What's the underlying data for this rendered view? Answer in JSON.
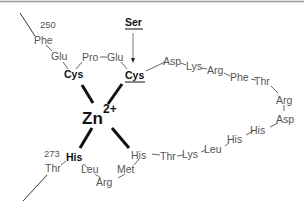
{
  "diagram": {
    "metal": {
      "symbol": "Zn",
      "charge": "2+"
    },
    "labels": {
      "start_number": "250",
      "end_number": "273",
      "mutation_label": "Ser"
    },
    "residues": {
      "phe250": "Phe",
      "glu1": "Glu",
      "cys1": "Cys",
      "pro": "Pro",
      "glu2": "Glu",
      "cys2": "Cys",
      "asp1": "Asp",
      "lys1": "Lys",
      "arg1": "Arg",
      "phe2": "Phe",
      "thr1": "Thr",
      "arg2": "Arg",
      "asp2": "Asp",
      "his_a": "His",
      "his_b": "His",
      "leu1": "Leu",
      "lys2": "Lys",
      "thr2": "Thr",
      "his2": "His",
      "met": "Met",
      "arg3": "Arg",
      "leu2": "Leu",
      "his1": "His",
      "thr273": "Thr"
    },
    "ligands": [
      "Cys",
      "Cys",
      "His",
      "His"
    ],
    "colors": {
      "ligand": "#111111",
      "residue": "#555555",
      "border": "#999999"
    }
  }
}
